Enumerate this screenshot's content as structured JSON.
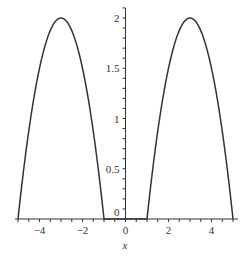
{
  "chart_data": {
    "type": "line",
    "title": "",
    "xlabel": "x",
    "ylabel": "",
    "xlim": [
      -5,
      5
    ],
    "ylim": [
      0,
      2
    ],
    "grid": false,
    "legend": null,
    "x_ticks": [
      -4,
      -2,
      0,
      2,
      4
    ],
    "x_tick_labels": [
      "−4",
      "−2",
      "0",
      "2",
      "4"
    ],
    "y_ticks": [
      0,
      0.5,
      1,
      1.5,
      2
    ],
    "y_tick_labels": [
      "0",
      "0.5",
      "1",
      "1.5",
      "2"
    ],
    "series": [
      {
        "name": "f(x)",
        "color": "#333333",
        "x": [
          -5,
          -4.5,
          -4,
          -3.5,
          -3,
          -2.5,
          -2,
          -1.5,
          -1,
          -0.5,
          0,
          0.5,
          1,
          1.5,
          2,
          2.5,
          3,
          3.5,
          4,
          4.5,
          5
        ],
        "y": [
          0,
          0.875,
          1.5,
          1.875,
          2,
          1.875,
          1.5,
          0.875,
          0,
          0,
          0,
          0,
          0,
          0.875,
          1.5,
          1.875,
          2,
          1.875,
          1.5,
          0.875,
          0
        ]
      }
    ]
  },
  "axes": {
    "x_title": "x",
    "line_color": "#333333"
  }
}
